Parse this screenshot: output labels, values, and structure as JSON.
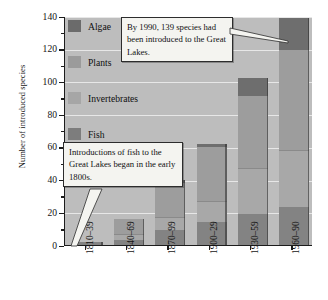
{
  "chart_data": {
    "type": "bar",
    "subtype": "stacked",
    "title": "",
    "xlabel": "",
    "ylabel": "Number of introduced species",
    "categories": [
      "1810–39",
      "1840–69",
      "1870–99",
      "1900–29",
      "1930–59",
      "1960–90"
    ],
    "series": [
      {
        "name": "Fish",
        "color": "#7d7d7d",
        "values": [
          2,
          3,
          9,
          14,
          19,
          23
        ]
      },
      {
        "name": "Invertebrates",
        "color": "#a6a6a6",
        "values": [
          0,
          4,
          8,
          13,
          28,
          35
        ]
      },
      {
        "name": "Plants",
        "color": "#9b9b9b",
        "values": [
          0,
          9,
          21,
          33,
          44,
          61
        ]
      },
      {
        "name": "Algae",
        "color": "#6b6b6b",
        "values": [
          0,
          0,
          2,
          2,
          11,
          20
        ]
      }
    ],
    "totals": [
      2,
      16,
      40,
      62,
      102,
      139
    ],
    "ylim": [
      0,
      140
    ],
    "yticks": [
      0,
      20,
      40,
      60,
      80,
      100,
      120,
      140
    ],
    "yticks_minor": [
      10,
      30,
      50,
      70,
      90,
      110,
      130
    ],
    "grid": true,
    "grid_color": "#eeeeee",
    "plot_background": "#bdbdbd",
    "legend_position": "top-left",
    "annotations": [
      {
        "id": "callout-1990",
        "text": "By 1990, 139 species had been introduced to the Great Lakes.",
        "points_to": "1960–90"
      },
      {
        "id": "callout-fish",
        "text": "Introductions of fish to the Great Lakes began in the early 1800s.",
        "points_to": "1810–39"
      }
    ]
  },
  "axes": {
    "ylabel": "Number of introduced species",
    "ytick_labels": [
      "0",
      "20",
      "40",
      "60",
      "80",
      "100",
      "120",
      "140"
    ],
    "xtick_labels": [
      "1810–39",
      "1840–69",
      "1870–99",
      "1900–29",
      "1930–59",
      "1960–90"
    ]
  },
  "legend": {
    "items": [
      {
        "label": "Algae",
        "color": "#6b6b6b"
      },
      {
        "label": "Plants",
        "color": "#9b9b9b"
      },
      {
        "label": "Invertebrates",
        "color": "#a6a6a6"
      },
      {
        "label": "Fish",
        "color": "#7d7d7d"
      }
    ]
  },
  "callouts": {
    "top": "By 1990, 139 species had been introduced to the Great Lakes.",
    "bottom": "Introductions of fish to the Great Lakes began in the early 1800s."
  }
}
